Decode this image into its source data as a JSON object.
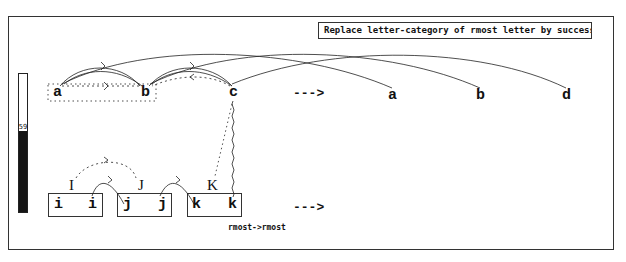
{
  "rule": {
    "text": "Replace letter-category of rmost letter by successor"
  },
  "status": {
    "codelets_text": "Number of codelets run so far: 255",
    "codelets_count": 255
  },
  "temperature": {
    "value": "59",
    "percent": 59
  },
  "workspace": {
    "initial_string": [
      "a",
      "b",
      "c"
    ],
    "modified_string": [
      "a",
      "b",
      "d"
    ],
    "target_string": [
      "i",
      "i",
      "j",
      "j",
      "k",
      "k"
    ],
    "target_groups": [
      {
        "category": "I",
        "letters": [
          "i",
          "i"
        ]
      },
      {
        "category": "J",
        "letters": [
          "j",
          "j"
        ]
      },
      {
        "category": "K",
        "letters": [
          "k",
          "k"
        ]
      }
    ],
    "answer_string": [],
    "top_arrow": "--->",
    "bottom_arrow": "--->",
    "bond_label": "rmost->rmost"
  }
}
